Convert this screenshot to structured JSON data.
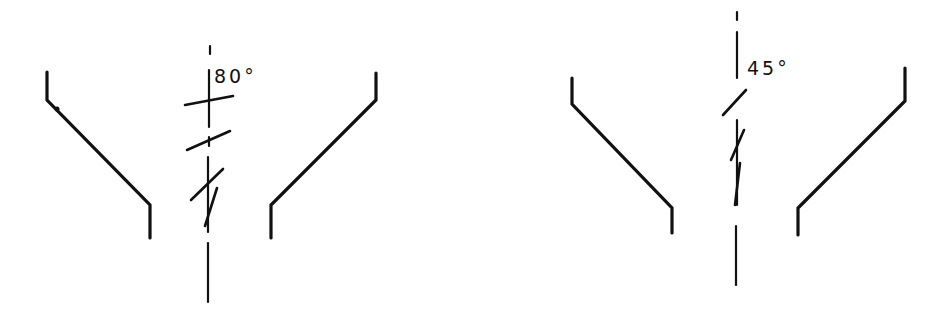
{
  "figure": {
    "type": "technical-diagram",
    "panels": [
      {
        "id": "left",
        "angle_label": "80°",
        "angle_value": 80
      },
      {
        "id": "right",
        "angle_label": "45°",
        "angle_value": 45
      }
    ],
    "colors": {
      "line": "#111111",
      "background": "#ffffff"
    }
  }
}
